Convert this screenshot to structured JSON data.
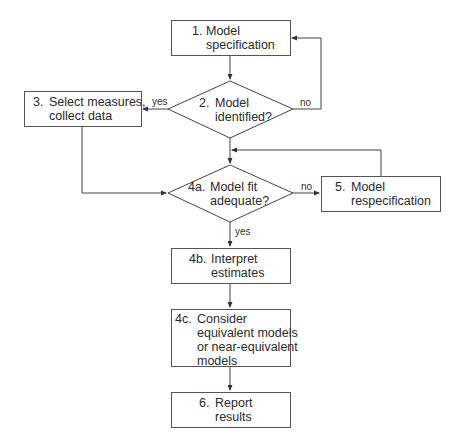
{
  "diagram": {
    "type": "flowchart",
    "nodes": {
      "n1": {
        "num": "1.",
        "lines": [
          "Model",
          "specification"
        ],
        "shape": "box"
      },
      "n2": {
        "num": "2.",
        "lines": [
          "Model",
          "identified?"
        ],
        "shape": "diamond"
      },
      "n3": {
        "num": "3.",
        "lines": [
          "Select measures,",
          "collect data"
        ],
        "shape": "box"
      },
      "n4a": {
        "num": "4a.",
        "lines": [
          "Model fit",
          "adequate?"
        ],
        "shape": "diamond"
      },
      "n5": {
        "num": "5.",
        "lines": [
          "Model",
          "respecification"
        ],
        "shape": "box"
      },
      "n4b": {
        "num": "4b.",
        "lines": [
          "Interpret",
          "estimates"
        ],
        "shape": "box"
      },
      "n4c": {
        "num": "4c.",
        "lines": [
          "Consider",
          "equivalent models",
          "or near-equivalent",
          "models"
        ],
        "shape": "box"
      },
      "n6": {
        "num": "6.",
        "lines": [
          "Report",
          "results"
        ],
        "shape": "box"
      }
    },
    "edge_labels": {
      "n2_yes": "yes",
      "n2_no": "no",
      "n4a_no": "no",
      "n4a_yes": "yes"
    },
    "edges": [
      {
        "from": "n1",
        "to": "n2"
      },
      {
        "from": "n2",
        "to": "n3",
        "label": "yes"
      },
      {
        "from": "n2",
        "to": "n1",
        "label": "no"
      },
      {
        "from": "n2",
        "to": "n4a"
      },
      {
        "from": "n3",
        "to": "n4a"
      },
      {
        "from": "n4a",
        "to": "n5",
        "label": "no"
      },
      {
        "from": "n5",
        "to": "n4a"
      },
      {
        "from": "n4a",
        "to": "n4b",
        "label": "yes"
      },
      {
        "from": "n4b",
        "to": "n4c"
      },
      {
        "from": "n4c",
        "to": "n6"
      }
    ],
    "colors": {
      "line": "#444444",
      "text": "#2a2a2a",
      "background": "#ffffff"
    }
  }
}
